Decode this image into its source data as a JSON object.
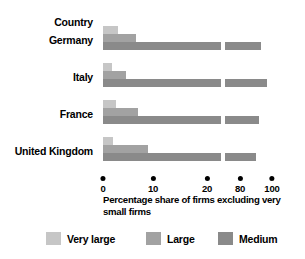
{
  "chart_data": {
    "type": "bar",
    "orientation": "horizontal",
    "title": "",
    "xlabel": "Percentage share of firms excluding very small firms",
    "ylabel": "Country",
    "categories": [
      "Germany",
      "Italy",
      "France",
      "United Kingdom"
    ],
    "series": [
      {
        "name": "Very large",
        "color": "#c6c6c6",
        "values": [
          3,
          1.8,
          2.5,
          2
        ]
      },
      {
        "name": "Large",
        "color": "#a2a2a2",
        "values": [
          6.5,
          4.5,
          7,
          9
        ]
      },
      {
        "name": "Medium",
        "color": "#8a8a8a",
        "values": [
          93,
          97,
          92,
          90
        ]
      }
    ],
    "xticks": [
      {
        "label": "0",
        "value": 0
      },
      {
        "label": "10",
        "value": 10
      },
      {
        "label": "20",
        "value": 20
      },
      {
        "label": "80",
        "value": 80
      },
      {
        "label": "100",
        "value": 100
      }
    ],
    "axis_break": {
      "present": true,
      "from": 20,
      "to": 80
    },
    "grid": false,
    "legend_position": "bottom"
  },
  "axis": {
    "category_header": "Country",
    "caption_line1": "Percentage share of firms excluding very",
    "caption_line2": "small firms",
    "tick_0": "0",
    "tick_10": "10",
    "tick_20": "20",
    "tick_80": "80",
    "tick_100": "100"
  },
  "categories": {
    "c0": "Germany",
    "c1": "Italy",
    "c2": "France",
    "c3": "United Kingdom"
  },
  "legend": {
    "very_large": "Very large",
    "large": "Large",
    "medium": "Medium"
  },
  "colors": {
    "very_large": "#c6c6c6",
    "large": "#a2a2a2",
    "medium": "#8a8a8a",
    "background": "#ffffff",
    "text": "#000000"
  }
}
